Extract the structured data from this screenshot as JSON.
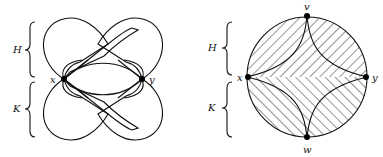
{
  "figure": {
    "left_panel": {
      "brace_labels": [
        "H",
        "K"
      ],
      "vertex_labels": {
        "left": "x",
        "right": "y"
      },
      "description": "Two intertwined figure-eight bands through vertices x and y; hatched lobes above (H) and below (K)"
    },
    "right_panel": {
      "brace_labels": [
        "H",
        "K"
      ],
      "vertex_labels": {
        "top": "v",
        "bottom": "w",
        "left": "x",
        "right": "y"
      },
      "description": "Circle with four cusped hatched regions meeting at vertices v, y, w, x; unhatched four-pointed star in center"
    }
  }
}
